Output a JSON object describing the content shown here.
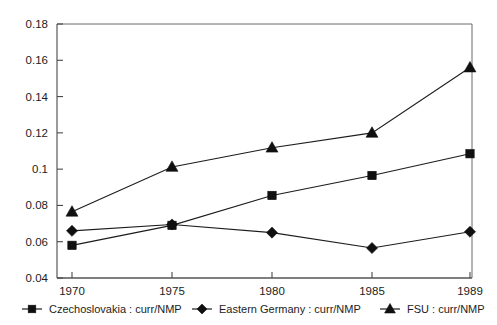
{
  "chart_data": {
    "type": "line",
    "title": "",
    "xlabel": "",
    "ylabel": "",
    "x": [
      1970,
      1975,
      1980,
      1985,
      1989
    ],
    "categories": [
      "1970",
      "1975",
      "1980",
      "1985",
      "1989"
    ],
    "xtick_labels": [
      "1970",
      "1975",
      "1980",
      "1985",
      "1989"
    ],
    "ytick_labels": [
      "0.18",
      "0.16",
      "0.14",
      "0.12",
      "0.1",
      "0.08",
      "0.06",
      "0.04"
    ],
    "ytick_values": [
      0.18,
      0.16,
      0.14,
      0.12,
      0.1,
      0.08,
      0.06,
      0.04
    ],
    "ylim": [
      0.04,
      0.18
    ],
    "xlim": [
      1970,
      1989
    ],
    "grid": false,
    "legend_position": "bottom",
    "series": [
      {
        "name": "Czechoslovakia : curr/NMP",
        "marker": "square",
        "color": "#101010",
        "values": [
          0.058,
          0.069,
          0.0855,
          0.0965,
          0.1085
        ]
      },
      {
        "name": "Eastern Germany : curr/NMP",
        "marker": "diamond",
        "color": "#101010",
        "values": [
          0.066,
          0.0695,
          0.065,
          0.0565,
          0.0655
        ]
      },
      {
        "name": "FSU : curr/NMP",
        "marker": "triangle",
        "color": "#101010",
        "values": [
          0.0765,
          0.1012,
          0.1118,
          0.12,
          0.156
        ]
      }
    ]
  },
  "legend": {
    "items": [
      {
        "label": "Czechoslovakia : curr/NMP",
        "marker": "square"
      },
      {
        "label": "Eastern Germany : curr/NMP",
        "marker": "diamond"
      },
      {
        "label": "FSU : curr/NMP",
        "marker": "triangle"
      }
    ]
  },
  "axes": {
    "y_labels": [
      "0.18",
      "0.16",
      "0.14",
      "0.12",
      "0.1",
      "0.08",
      "0.06",
      "0.04"
    ],
    "x_labels": [
      "1970",
      "1975",
      "1980",
      "1985",
      "1989"
    ]
  },
  "colors": {
    "ink": "#101010",
    "axis": "#4a4a4a",
    "frame": "#6a6a6a",
    "background": "#ffffff"
  }
}
